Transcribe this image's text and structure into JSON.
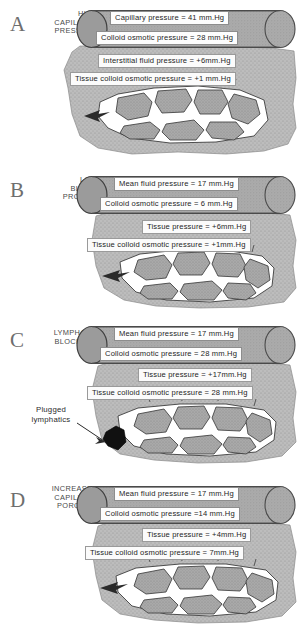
{
  "figure": {
    "units": "mm.Hg",
    "colors": {
      "tube_fill": "#a8a8a8",
      "tube_cap": "#9b9b9b",
      "tissue_fill": "#b9b9b9",
      "cell_fill": "#a2a2a2",
      "channel_fill": "#ffffff",
      "outline": "#3a3a3a",
      "letter": "#6e6e6e",
      "plug": "#111111"
    }
  },
  "panels": [
    {
      "letter": "A",
      "caption": "HIGH CAPILLARY PRESSURE",
      "caption_lines": [
        "HIGH",
        "CAPILLARY",
        "PRESSURE"
      ],
      "capillary_labels": [
        "Capillary  pressure = 41  mm.Hg",
        "Colloid  osmotic pressure = 28 mm.Hg"
      ],
      "tissue_labels": [
        "Interstitial  fluid pressure = +6mm.Hg",
        "Tissue colloid osmotic pressure = +1 mm.Hg"
      ],
      "values": {
        "capillary_pressure": 41,
        "colloid_osmotic_pressure": 28,
        "interstitial_fluid_pressure": 6,
        "tissue_colloid_osmotic_pressure": 1
      }
    },
    {
      "letter": "B",
      "caption": "LOW BLOOD PROTEIN",
      "caption_lines": [
        "LOW",
        "BLOOD",
        "PROTEIN"
      ],
      "capillary_labels": [
        "Mean fluid pressure = 17  mm.Hg",
        "Colloid  osmotic pressure =  6  mm.Hg"
      ],
      "tissue_labels": [
        "Tissue pressure = +6mm.Hg",
        "Tissue  colloid  osmotic  pressure = +1mm.Hg"
      ],
      "values": {
        "mean_fluid_pressure": 17,
        "colloid_osmotic_pressure": 6,
        "tissue_pressure": 6,
        "tissue_colloid_osmotic_pressure": 1
      }
    },
    {
      "letter": "C",
      "caption": "LYMPHATIC BLOCKAGE",
      "caption_lines": [
        "LYMPHATIC",
        "BLOCKAGE"
      ],
      "capillary_labels": [
        "Mean fluid pressure = 17  mm.Hg",
        "Colloid  osmotic pressure = 28 mm.Hg"
      ],
      "tissue_labels": [
        "Tissue pressure = +17mm.Hg",
        "Tissue colloid osmotic pressure = 28 mm.Hg"
      ],
      "annotation": {
        "lines": [
          "Plugged",
          "lymphatics"
        ],
        "text": "Plugged lymphatics"
      },
      "values": {
        "mean_fluid_pressure": 17,
        "colloid_osmotic_pressure": 28,
        "tissue_pressure": 17,
        "tissue_colloid_osmotic_pressure": 28
      }
    },
    {
      "letter": "D",
      "caption": "INCREASED CAPILLARY POROSITY",
      "caption_lines": [
        "INCREASED",
        "CAPILLARY",
        "POROSITY"
      ],
      "capillary_labels": [
        "Mean fluid pressure = 17  mm.Hg",
        "Colloid  osmotic pressure =14 mm.Hg"
      ],
      "tissue_labels": [
        "Tissue pressure = +4mm.Hg",
        "Tissue  colloid  osmotic pressure =  7mm.Hg"
      ],
      "values": {
        "mean_fluid_pressure": 17,
        "colloid_osmotic_pressure": 14,
        "tissue_pressure": 4,
        "tissue_colloid_osmotic_pressure": 7
      }
    }
  ]
}
